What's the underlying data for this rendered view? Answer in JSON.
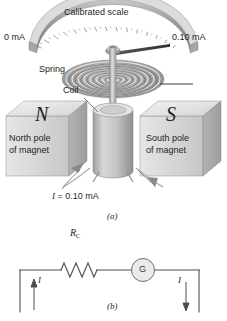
{
  "figure": {
    "panel_a": {
      "caption": "(a)",
      "labels": {
        "scale_title": "Calibrated scale",
        "scale_min": "0 mA",
        "scale_max": "0.10 mA",
        "spring": "Spring",
        "coil": "Coil",
        "north_pole_letter": "N",
        "south_pole_letter": "S",
        "north_pole_line1": "North pole",
        "north_pole_line2": "of magnet",
        "south_pole_line1": "South pole",
        "south_pole_line2": "of magnet",
        "current_label_symbol": "I",
        "current_label_rest": " = 0.10 mA"
      }
    },
    "panel_b": {
      "caption": "(b)",
      "labels": {
        "resistor_symbol": "R",
        "resistor_subscript": "C",
        "galvanometer": "G",
        "current_left": "I",
        "current_right": "I"
      }
    },
    "colors": {
      "ink": "#231f20",
      "line": "#6d6e71",
      "magnet_face": "#d9d9d9",
      "magnet_top": "#ededed",
      "magnet_side": "#b9b9b9",
      "coil_body": "#bfbfbf",
      "scale_band": "#a8a8a8",
      "background": "#ffffff"
    }
  }
}
